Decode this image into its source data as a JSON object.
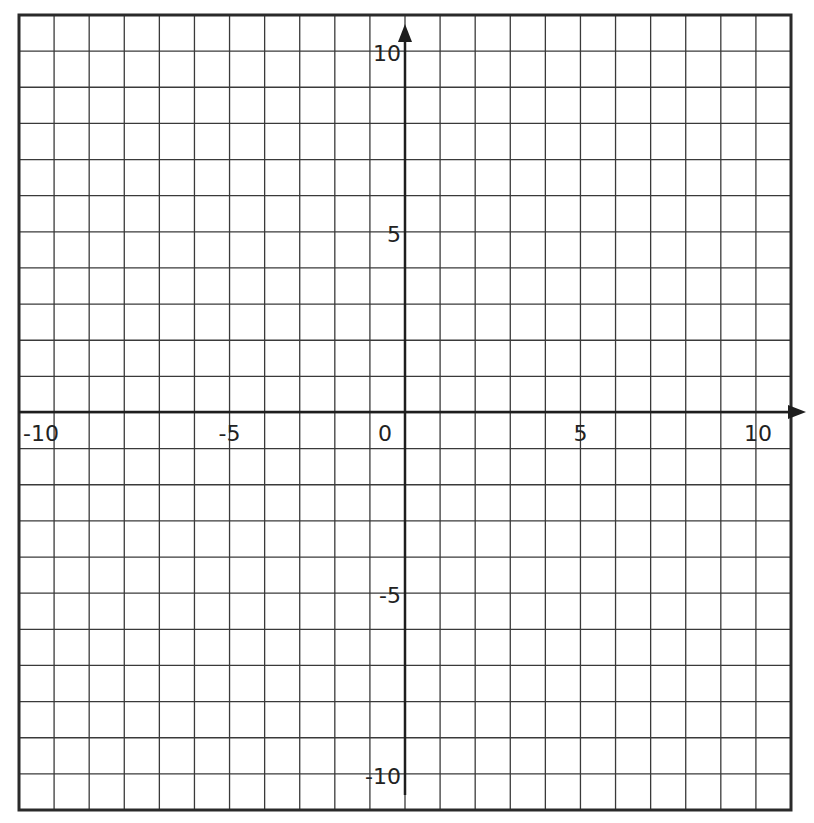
{
  "diagram": {
    "type": "coordinate-plane",
    "x_range": [
      -11,
      11
    ],
    "y_range": [
      -11,
      11
    ],
    "grid_step": 1,
    "x_labels": [
      {
        "value": -10,
        "text": "-10"
      },
      {
        "value": -5,
        "text": "-5"
      },
      {
        "value": 0,
        "text": "0"
      },
      {
        "value": 5,
        "text": "5"
      },
      {
        "value": 10,
        "text": "10"
      }
    ],
    "y_labels": [
      {
        "value": 10,
        "text": "10"
      },
      {
        "value": 5,
        "text": "5"
      },
      {
        "value": -5,
        "text": "-5"
      },
      {
        "value": -10,
        "text": "-10"
      }
    ],
    "colors": {
      "grid_line": "#3a3a3a",
      "axis": "#1e1e1e",
      "label": "#222222",
      "background": "#ffffff"
    }
  }
}
